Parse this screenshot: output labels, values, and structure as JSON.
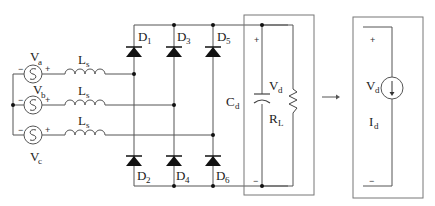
{
  "diagram": {
    "sources": [
      {
        "id": "Va",
        "label": "V",
        "sub": "a",
        "minus": "−",
        "plus": "+"
      },
      {
        "id": "Vb",
        "label": "V",
        "sub": "b",
        "minus": "−",
        "plus": "+"
      },
      {
        "id": "Vc",
        "label": "V",
        "sub": "c",
        "minus": "−",
        "plus": "+"
      }
    ],
    "inductors": [
      {
        "label": "L",
        "sub": "s"
      },
      {
        "label": "L",
        "sub": "s"
      },
      {
        "label": "L",
        "sub": "s"
      }
    ],
    "diodes": [
      {
        "label": "D",
        "sub": "1"
      },
      {
        "label": "D",
        "sub": "3"
      },
      {
        "label": "D",
        "sub": "5"
      },
      {
        "label": "D",
        "sub": "2"
      },
      {
        "label": "D",
        "sub": "4"
      },
      {
        "label": "D",
        "sub": "6"
      }
    ],
    "load": {
      "capacitor": {
        "label": "C",
        "sub": "d"
      },
      "voltage": {
        "label": "V",
        "sub": "d"
      },
      "resistor": {
        "label": "R",
        "sub": "L"
      },
      "plus": "+",
      "minus": "−"
    },
    "arrow": "→",
    "equivalent": {
      "voltage": {
        "label": "V",
        "sub": "d"
      },
      "current": {
        "label": "I",
        "sub": "d"
      },
      "plus": "+",
      "minus": "−"
    }
  }
}
